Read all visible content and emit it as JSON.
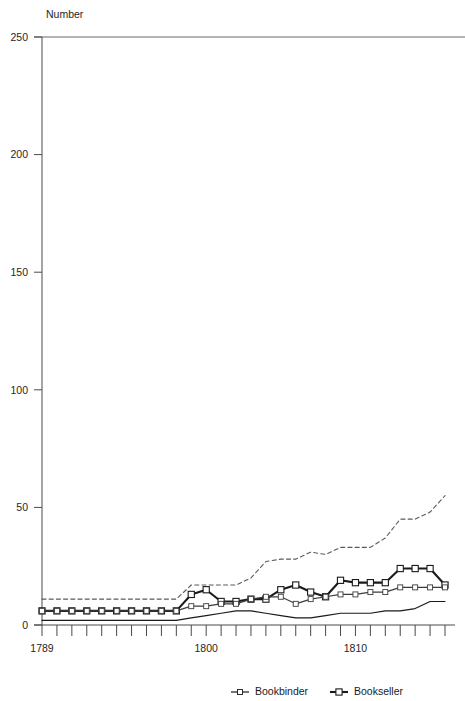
{
  "chart_data": {
    "type": "line",
    "title": "",
    "subtitle": "",
    "ylabel": "Number",
    "xlabel": "",
    "ylim": [
      0,
      250
    ],
    "yticks": [
      0,
      50,
      100,
      150,
      200,
      250
    ],
    "ytick_labels": [
      "0",
      "50",
      "100",
      "150",
      "200",
      "250"
    ],
    "xlim": [
      1789,
      1816
    ],
    "xticks": [
      1789,
      1790,
      1791,
      1792,
      1793,
      1794,
      1795,
      1796,
      1797,
      1798,
      1799,
      1800,
      1801,
      1802,
      1803,
      1804,
      1805,
      1806,
      1807,
      1808,
      1809,
      1810,
      1811,
      1812,
      1813,
      1814,
      1815,
      1816
    ],
    "xtick_labels_shown": [
      "1789",
      "1800",
      "1810"
    ],
    "xtick_labels_shown_values": [
      1789,
      1800,
      1810
    ],
    "grid": false,
    "legend_position": "bottom",
    "x": [
      1789,
      1790,
      1791,
      1792,
      1793,
      1794,
      1795,
      1796,
      1797,
      1798,
      1799,
      1800,
      1801,
      1802,
      1803,
      1804,
      1805,
      1806,
      1807,
      1808,
      1809,
      1810,
      1811,
      1812,
      1813,
      1814,
      1815,
      1816
    ],
    "series": [
      {
        "name": "Bookseller",
        "style": "solid-bold-square",
        "color": "#1a1a1a",
        "marker": "square",
        "values": [
          6,
          6,
          6,
          6,
          6,
          6,
          6,
          6,
          6,
          6,
          13,
          15,
          10,
          10,
          11,
          11,
          15,
          17,
          14,
          12,
          19,
          18,
          18,
          18,
          24,
          24,
          24,
          17
        ]
      },
      {
        "name": "Bookbinder",
        "style": "solid-thin-square",
        "color": "#3c3c3c",
        "marker": "square",
        "values": [
          6,
          6,
          6,
          6,
          6,
          6,
          6,
          6,
          6,
          6,
          8,
          8,
          9,
          9,
          11,
          12,
          12,
          9,
          11,
          12,
          13,
          13,
          14,
          14,
          16,
          16,
          16,
          16
        ]
      },
      {
        "name": "dashed-upper-line",
        "style": "dashed",
        "color": "#5a5a5a",
        "marker": "none",
        "values": [
          11,
          11,
          11,
          11,
          11,
          11,
          11,
          11,
          11,
          11,
          17,
          17,
          17,
          17,
          20,
          27,
          28,
          28,
          31,
          30,
          33,
          33,
          33,
          37,
          45,
          45,
          48,
          55
        ]
      },
      {
        "name": "solid-lower-line",
        "style": "solid-thin",
        "color": "#1a1a1a",
        "marker": "none",
        "values": [
          2,
          2,
          2,
          2,
          2,
          2,
          2,
          2,
          2,
          2,
          3,
          4,
          5,
          6,
          6,
          5,
          4,
          3,
          3,
          4,
          5,
          5,
          5,
          6,
          6,
          7,
          10,
          10
        ]
      }
    ],
    "legend": [
      {
        "label": "Bookbinder",
        "marker": "square",
        "style": "solid-thin-square"
      },
      {
        "label": "Bookseller",
        "marker": "square",
        "style": "solid-bold-square"
      }
    ]
  }
}
